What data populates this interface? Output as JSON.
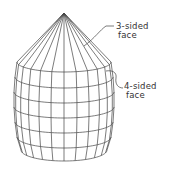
{
  "diagram": {
    "labels": {
      "three_sided": {
        "line1": "3-sided",
        "line2": "face"
      },
      "four_sided": {
        "line1": "4-sided",
        "line2": "face"
      }
    },
    "mesh": {
      "apex": [
        64,
        13
      ],
      "meridians": 12,
      "rings": 7
    },
    "colors": {
      "line": "#444444",
      "background": "#ffffff"
    }
  }
}
